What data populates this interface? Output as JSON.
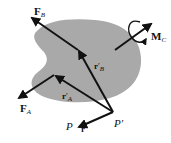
{
  "diagram": {
    "type": "rigid-body-force-system",
    "colors": {
      "body_fill": "#a9a9a9",
      "vector": "#111111",
      "background": "#ffffff"
    },
    "labels": {
      "force_b": {
        "main": "F",
        "sub": "B"
      },
      "force_a": {
        "main": "F",
        "sub": "A"
      },
      "couple_c": {
        "main": "M",
        "sub": "C"
      },
      "pos_b": {
        "main": "r",
        "prime": "′",
        "sub": "B"
      },
      "pos_a": {
        "main": "r",
        "prime": "′",
        "sub": "A"
      },
      "point_p": "P",
      "point_p_prime": "P′",
      "vec_r": "r"
    }
  }
}
